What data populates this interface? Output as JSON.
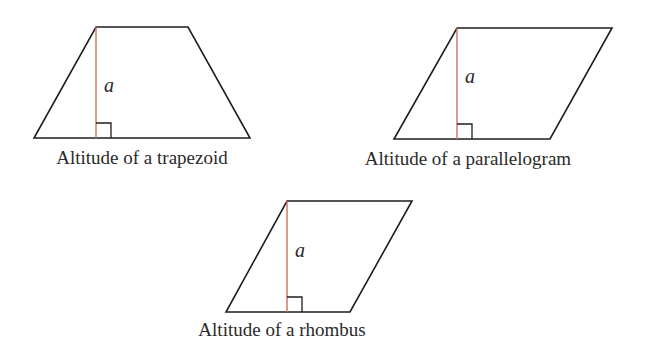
{
  "figures": [
    {
      "id": "trapezoid",
      "caption": "Altitude of a trapezoid",
      "altitude_label": "a"
    },
    {
      "id": "parallelogram",
      "caption": "Altitude of a parallelogram",
      "altitude_label": "a"
    },
    {
      "id": "rhombus",
      "caption": "Altitude of a rhombus",
      "altitude_label": "a"
    }
  ],
  "colors": {
    "outline": "#1e1e1e",
    "altitude": "#d0705a",
    "text": "#2a2a2a"
  }
}
